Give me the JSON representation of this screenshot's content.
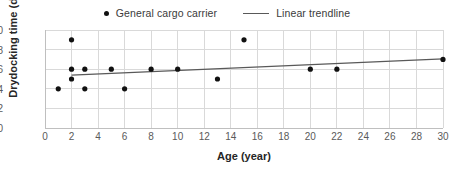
{
  "chart_data": {
    "type": "scatter",
    "title": "",
    "xlabel": "Age (year)",
    "ylabel": "Drydocking time (day)",
    "xlim": [
      0,
      30
    ],
    "ylim": [
      0,
      10
    ],
    "xticks": [
      0,
      2,
      4,
      6,
      8,
      10,
      12,
      14,
      16,
      18,
      20,
      22,
      24,
      26,
      28,
      30
    ],
    "yticks": [
      0,
      2,
      4,
      6,
      8,
      10
    ],
    "grid": true,
    "legend_position": "top-center",
    "series": [
      {
        "name": "General cargo carrier",
        "type": "scatter",
        "marker": "circle",
        "color": "#111111",
        "points": [
          {
            "x": 1,
            "y": 4
          },
          {
            "x": 2,
            "y": 9
          },
          {
            "x": 2,
            "y": 6
          },
          {
            "x": 2,
            "y": 5
          },
          {
            "x": 3,
            "y": 6
          },
          {
            "x": 3,
            "y": 4
          },
          {
            "x": 5,
            "y": 6
          },
          {
            "x": 6,
            "y": 4
          },
          {
            "x": 8,
            "y": 6
          },
          {
            "x": 10,
            "y": 6
          },
          {
            "x": 13,
            "y": 5
          },
          {
            "x": 15,
            "y": 9
          },
          {
            "x": 20,
            "y": 6
          },
          {
            "x": 22,
            "y": 6
          },
          {
            "x": 30,
            "y": 7
          }
        ]
      },
      {
        "name": "Linear trendline",
        "type": "line",
        "color": "#595959",
        "points": [
          {
            "x": 2,
            "y": 5.4
          },
          {
            "x": 30,
            "y": 7.05
          }
        ]
      }
    ]
  },
  "legend": {
    "entries": [
      {
        "label": "General cargo carrier",
        "marker": "dot"
      },
      {
        "label": "Linear trendline",
        "marker": "line"
      }
    ]
  },
  "colors": {
    "marker": "#111111",
    "trendline": "#595959",
    "grid": "#d9d9d9",
    "axis": "#bfbfbf",
    "tick_text": "#5a5a5a",
    "axis_title": "#262626"
  }
}
